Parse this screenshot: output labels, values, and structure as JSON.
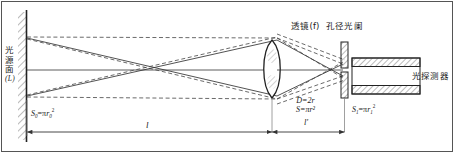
{
  "figure": {
    "frame_color": "#5a5a5a",
    "line_color": "#222222",
    "dashed_ray_color": "#444444",
    "solid_ray_color": "#333333",
    "hatch_color": "#555555",
    "text_color": "#1a1a1a"
  },
  "labels": {
    "source_plane": {
      "chars": [
        "光",
        "源",
        "面"
      ],
      "paren": "(L)",
      "full": "光源面 (L)"
    },
    "lens": "透镜(f)",
    "aperture_stop": "孔径光阑",
    "photodetector": "光探测器"
  },
  "formulas": {
    "source_area": {
      "lhs": "S",
      "lhs_sub": "0",
      "eq": "=",
      "pi": "π",
      "r": "r",
      "r_sub": "0",
      "r_sup": "2",
      "full": "S₀=πr₀²"
    },
    "lens_diameter": {
      "full": "D=2r",
      "lhs": "D",
      "eq": "=",
      "value": "2r"
    },
    "lens_area": {
      "full": "S=πr²",
      "lhs": "S",
      "eq": "=",
      "pi": "π",
      "r": "r",
      "r_sup": "2"
    },
    "detector_area": {
      "lhs": "S",
      "lhs_sub": "1",
      "eq": "=",
      "pi": "π",
      "r": "r",
      "r_sub": "1",
      "r_sup": "2",
      "full": "S₁=πr₁²"
    }
  },
  "dimensions": {
    "object_distance": "l",
    "image_distance": "l'"
  }
}
